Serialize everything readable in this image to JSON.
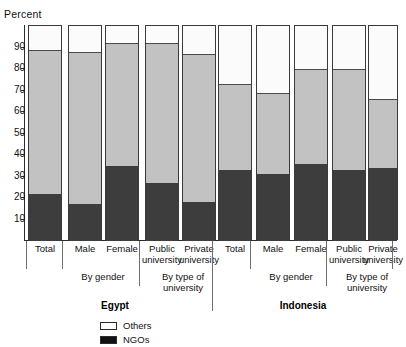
{
  "header": {
    "clipped_title": "",
    "axis_title": "Percent"
  },
  "legend": {
    "items": [
      {
        "label": "Others",
        "color": "#ffffff",
        "icon": "square-outline-icon"
      },
      {
        "label": "NGOs",
        "color": "#111111",
        "icon": "square-filled-icon"
      }
    ]
  },
  "axis": {
    "ylabel": "Percent",
    "ticks": [
      "90",
      "80",
      "70",
      "60",
      "50",
      "40",
      "30",
      "20",
      "10"
    ],
    "tick_values": [
      90,
      80,
      70,
      60,
      50,
      40,
      30,
      20,
      10
    ],
    "ymin": 0,
    "ymax": 100
  },
  "groups": [
    {
      "country": "Egypt",
      "subgroups": [
        {
          "label": "",
          "categories": [
            "Total"
          ]
        },
        {
          "label": "By gender",
          "categories": [
            "Male",
            "Female"
          ]
        },
        {
          "label": "By type of university",
          "categories": [
            "Public university",
            "Private university"
          ]
        }
      ]
    },
    {
      "country": "Indonesia",
      "subgroups": [
        {
          "label": "",
          "categories": [
            "Total"
          ]
        },
        {
          "label": "By gender",
          "categories": [
            "Male",
            "Female"
          ]
        },
        {
          "label": "By type of university",
          "categories": [
            "Public university",
            "Private university"
          ]
        }
      ]
    }
  ],
  "chart_data": {
    "type": "bar",
    "subtype": "stacked-percentage",
    "title": "",
    "xlabel": "",
    "ylabel": "Percent",
    "ylim": [
      0,
      100
    ],
    "grid": false,
    "legend_position": "bottom-left",
    "categories": [
      "Egypt – Total",
      "Egypt – Male",
      "Egypt – Female",
      "Egypt – Public university",
      "Egypt – Private university",
      "Indonesia – Total",
      "Indonesia – Male",
      "Indonesia – Female",
      "Indonesia – Public university",
      "Indonesia – Private university"
    ],
    "series": [
      {
        "name": "NGOs",
        "color": "#3d3d3d",
        "values": [
          22,
          17,
          35,
          27,
          18,
          33,
          31,
          36,
          33,
          34
        ]
      },
      {
        "name": "Middle",
        "color": "#c2c2c2",
        "values": [
          67,
          71,
          57,
          65,
          69,
          40,
          38,
          44,
          47,
          32
        ]
      },
      {
        "name": "Others",
        "color": "#ffffff",
        "values": [
          11,
          12,
          8,
          8,
          13,
          27,
          31,
          20,
          20,
          34
        ]
      }
    ],
    "bars": [
      {
        "category": "Total",
        "country": "Egypt",
        "ngos": 22,
        "middle": 67,
        "others": 11
      },
      {
        "category": "Male",
        "country": "Egypt",
        "ngos": 17,
        "middle": 71,
        "others": 12
      },
      {
        "category": "Female",
        "country": "Egypt",
        "ngos": 35,
        "middle": 57,
        "others": 8
      },
      {
        "category": "Public university",
        "country": "Egypt",
        "ngos": 27,
        "middle": 65,
        "others": 8
      },
      {
        "category": "Private university",
        "country": "Egypt",
        "ngos": 18,
        "middle": 69,
        "others": 13
      },
      {
        "category": "Total",
        "country": "Indonesia",
        "ngos": 33,
        "middle": 40,
        "others": 27
      },
      {
        "category": "Male",
        "country": "Indonesia",
        "ngos": 31,
        "middle": 38,
        "others": 31
      },
      {
        "category": "Female",
        "country": "Indonesia",
        "ngos": 36,
        "middle": 44,
        "others": 20
      },
      {
        "category": "Public university",
        "country": "Indonesia",
        "ngos": 33,
        "middle": 47,
        "others": 20
      },
      {
        "category": "Private university",
        "country": "Indonesia",
        "ngos": 34,
        "middle": 32,
        "others": 34
      }
    ]
  }
}
